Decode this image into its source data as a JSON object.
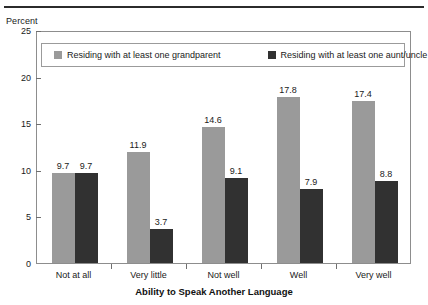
{
  "top_rule": true,
  "chart_data": {
    "type": "bar",
    "title": "",
    "xlabel": "Ability to Speak Another Language",
    "ylabel": "Percent",
    "ylim": [
      0,
      25
    ],
    "yticks": [
      0,
      5,
      10,
      15,
      20,
      25
    ],
    "ytick_labels": [
      "0",
      "5",
      "10",
      "15",
      "20",
      "25"
    ],
    "grid": false,
    "legend_position": "top-inside",
    "categories": [
      "Not at all",
      "Very little",
      "Not well",
      "Well",
      "Very well"
    ],
    "series": [
      {
        "name": "Residing with at least one grandparent",
        "color": "#9a9a9a",
        "values": [
          9.7,
          11.9,
          14.6,
          17.8,
          17.4
        ],
        "labels": [
          "9.7",
          "11.9",
          "14.6",
          "17.8",
          "17.4"
        ]
      },
      {
        "name": "Residing with at least one aunt/uncle",
        "color": "#313131",
        "values": [
          9.7,
          3.7,
          9.1,
          7.9,
          8.8
        ],
        "labels": [
          "9.7",
          "3.7",
          "9.1",
          "7.9",
          "8.8"
        ]
      }
    ]
  },
  "legend": {
    "entries": [
      {
        "label": "Residing with at least one grandparent",
        "color": "#9a9a9a"
      },
      {
        "label": "Residing with at least one aunt/uncle",
        "color": "#313131"
      }
    ]
  }
}
